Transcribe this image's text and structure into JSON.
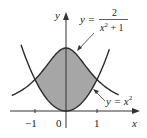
{
  "chart_data": {
    "type": "area",
    "title": "",
    "xlabel": "x",
    "ylabel": "y",
    "x_ticks": [
      "-1",
      "0",
      "1"
    ],
    "xlim": [
      -1.6,
      1.6
    ],
    "ylim": [
      0,
      2.4
    ],
    "series": [
      {
        "name": "y = 2/(x^2 + 1)",
        "formula": "2/(x^2+1)",
        "x": [
          -1.5,
          -1,
          -0.5,
          0,
          0.5,
          1,
          1.5
        ],
        "values": [
          0.62,
          1,
          1.6,
          2,
          1.6,
          1,
          0.62
        ]
      },
      {
        "name": "y = x^2",
        "formula": "x^2",
        "x": [
          -1.5,
          -1,
          -0.5,
          0,
          0.5,
          1,
          1.5
        ],
        "values": [
          2.25,
          1,
          0.25,
          0,
          0.25,
          1,
          2.25
        ]
      }
    ],
    "shaded_region": {
      "between": [
        "2/(x^2+1)",
        "x^2"
      ],
      "x_range": [
        -1,
        1
      ],
      "color": "#a6a6a6"
    },
    "intersections": [
      [
        -1,
        1
      ],
      [
        1,
        1
      ]
    ],
    "annotations": [
      {
        "text": "y = 2/(x^2 + 1)",
        "points_to": "upper curve"
      },
      {
        "text": "y = x^2",
        "points_to": "lower curve"
      }
    ]
  },
  "labels": {
    "y_axis": "y",
    "x_axis": "x",
    "tick_neg1": "−1",
    "tick_0": "0",
    "tick_1": "1",
    "upper_eq_lhs": "y =",
    "upper_eq_num": "2",
    "upper_eq_den_x": "x",
    "upper_eq_den_exp": "2",
    "upper_eq_den_rest": " + 1",
    "lower_eq_lhs": "y = ",
    "lower_eq_x": "x",
    "lower_eq_exp": "2"
  },
  "colors": {
    "shade": "#a6a6a6",
    "curve": "#2a2a2a",
    "axis": "#333333"
  }
}
